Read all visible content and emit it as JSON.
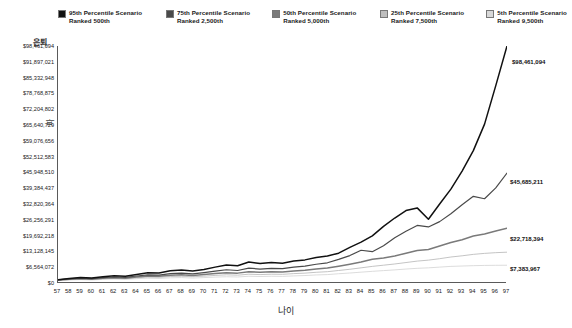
{
  "legend": {
    "items": [
      {
        "label_line1": "95th Percentile Scenario",
        "label_line2": "Ranked 500th",
        "color": "#111111"
      },
      {
        "label_line1": "75th Percentile Scenario",
        "label_line2": "Ranked 2,500th",
        "color": "#4a4a4a"
      },
      {
        "label_line1": "50th Percentile Scenario",
        "label_line2": "Ranked 5,000th",
        "color": "#7a7a7a"
      },
      {
        "label_line1": "25th Percentile Scenario",
        "label_line2": "Ranked 7,500th",
        "color": "#bdbdbd"
      },
      {
        "label_line1": "5th Percentile Scenario",
        "label_line2": "Ranked 9,500th",
        "color": "#d8d8d8"
      }
    ]
  },
  "axes": {
    "y_title_top": "은퇴",
    "y_title_rotated": "파",
    "x_title": "나이",
    "y_ticks": [
      "$98,461,094",
      "$91,897,021",
      "$85,332,948",
      "$78,768,875",
      "$72,204,802",
      "$65,640,729",
      "$59,076,656",
      "$52,512,583",
      "$45,948,510",
      "$39,384,437",
      "$32,820,364",
      "$26,256,291",
      "$19,692,218",
      "$13,128,145",
      "$6,564,072",
      "$0"
    ]
  },
  "end_labels": [
    {
      "text": "$98,461,094",
      "series": "95th Percentile Scenario"
    },
    {
      "text": "$45,685,211",
      "series": "75th Percentile Scenario"
    },
    {
      "text": "$22,718,394",
      "series": "50th Percentile Scenario"
    },
    {
      "text": "$7,383,967",
      "series": "5th Percentile Scenario"
    }
  ],
  "chart_data": {
    "type": "line",
    "title": "",
    "xlabel": "나이",
    "ylabel": "은퇴",
    "grid": false,
    "legend_position": "top",
    "xlim": [
      57,
      97
    ],
    "ylim": [
      0,
      98461094
    ],
    "y_tick_step": 6564072,
    "categories": [
      57,
      58,
      59,
      60,
      61,
      62,
      63,
      64,
      65,
      66,
      67,
      68,
      69,
      70,
      71,
      72,
      73,
      74,
      75,
      76,
      77,
      78,
      79,
      80,
      81,
      82,
      83,
      84,
      85,
      86,
      87,
      88,
      89,
      90,
      91,
      92,
      93,
      94,
      95,
      96,
      97
    ],
    "series": [
      {
        "name": "95th Percentile Scenario",
        "rank": "Ranked 500th",
        "color": "#111111",
        "end_value": 98461094,
        "values": [
          1400000,
          1900000,
          2300000,
          2100000,
          2600000,
          3000000,
          2800000,
          3500000,
          4300000,
          4200000,
          5100000,
          5400000,
          5000000,
          5600000,
          6600000,
          7500000,
          7200000,
          8700000,
          8100000,
          8500000,
          8200000,
          9100000,
          9600000,
          10600000,
          11200000,
          12400000,
          14800000,
          17000000,
          19600000,
          23500000,
          27000000,
          30100000,
          31200000,
          26500000,
          32800000,
          39000000,
          46500000,
          55000000,
          66000000,
          82000000,
          98461094
        ]
      },
      {
        "name": "75th Percentile Scenario",
        "rank": "Ranked 2,500th",
        "color": "#4a4a4a",
        "end_value": 45685211,
        "values": [
          1300000,
          1700000,
          2000000,
          1800000,
          2200000,
          2500000,
          2300000,
          2900000,
          3400000,
          3300000,
          3900000,
          4100000,
          3800000,
          4300000,
          4900000,
          5500000,
          5200000,
          6200000,
          5800000,
          6100000,
          6000000,
          6600000,
          7000000,
          7800000,
          8400000,
          9800000,
          11400000,
          13600000,
          13000000,
          15500000,
          18800000,
          21500000,
          23900000,
          23300000,
          25500000,
          28800000,
          32500000,
          36000000,
          35000000,
          39500000,
          45685211
        ]
      },
      {
        "name": "50th Percentile Scenario",
        "rank": "Ranked 5,000th",
        "color": "#7a7a7a",
        "end_value": 22718394,
        "values": [
          1200000,
          1550000,
          1800000,
          1600000,
          1950000,
          2200000,
          2000000,
          2500000,
          2900000,
          2800000,
          3200000,
          3400000,
          3150000,
          3500000,
          3900000,
          4300000,
          4100000,
          4700000,
          4500000,
          4700000,
          4600000,
          5000000,
          5300000,
          5800000,
          6200000,
          7000000,
          7800000,
          8700000,
          9900000,
          10400000,
          11200000,
          12400000,
          13500000,
          13900000,
          15400000,
          16800000,
          18000000,
          19500000,
          20400000,
          21600000,
          22718394
        ]
      },
      {
        "name": "25th Percentile Scenario",
        "rank": "Ranked 7,500th",
        "color": "#bdbdbd",
        "end_value": 12800000,
        "values": [
          1100000,
          1400000,
          1600000,
          1450000,
          1750000,
          1950000,
          1800000,
          2150000,
          2450000,
          2350000,
          2700000,
          2800000,
          2600000,
          2850000,
          3150000,
          3400000,
          3250000,
          3650000,
          3500000,
          3650000,
          3600000,
          3900000,
          4100000,
          4450000,
          4700000,
          5200000,
          5700000,
          6300000,
          6900000,
          7400000,
          7900000,
          8500000,
          9100000,
          9500000,
          10100000,
          10800000,
          11300000,
          11900000,
          12300000,
          12600000,
          12800000
        ]
      },
      {
        "name": "5th Percentile Scenario",
        "rank": "Ranked 9,500th",
        "color": "#d8d8d8",
        "end_value": 7383967,
        "values": [
          1000000,
          1250000,
          1400000,
          1250000,
          1500000,
          1650000,
          1500000,
          1800000,
          2000000,
          1900000,
          2150000,
          2250000,
          2050000,
          2250000,
          2450000,
          2600000,
          2500000,
          2800000,
          2700000,
          2800000,
          2750000,
          2950000,
          3100000,
          3350000,
          3500000,
          3850000,
          4150000,
          4500000,
          4850000,
          5150000,
          5450000,
          5800000,
          6100000,
          6300000,
          6600000,
          6900000,
          7050000,
          7200000,
          7300000,
          7350000,
          7383967
        ]
      }
    ]
  }
}
